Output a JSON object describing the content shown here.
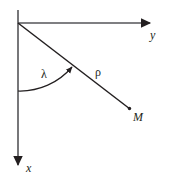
{
  "figure": {
    "background_color": "#ffffff",
    "stroke_color": "#231f20",
    "type": "polar-coordinate-diagram",
    "axes": {
      "horizontal": {
        "name": "y-axis",
        "label": "y",
        "from": [
          18,
          23
        ],
        "to": [
          157,
          23
        ],
        "arrow": "right"
      },
      "vertical": {
        "name": "x-axis",
        "label": "x",
        "from": [
          18,
          10
        ],
        "to": [
          18,
          172
        ],
        "arrow": "down"
      }
    },
    "ray": {
      "name": "rho-ray",
      "label": "ρ",
      "from": [
        18,
        23
      ],
      "to": [
        131,
        110
      ]
    },
    "point": {
      "name": "point-M",
      "label": "M",
      "at": [
        129,
        108
      ]
    },
    "angle": {
      "name": "lambda-angle",
      "label": "λ",
      "vertex": [
        18,
        23
      ],
      "from_axis": "x",
      "arc_start": [
        18,
        91
      ],
      "arc_end": [
        76,
        70
      ],
      "arrow": "counterclockwise-to-ray"
    }
  },
  "labels": {
    "y_axis": "y",
    "x_axis": "x",
    "lambda": "λ",
    "rho": "ρ",
    "point_m": "M"
  }
}
